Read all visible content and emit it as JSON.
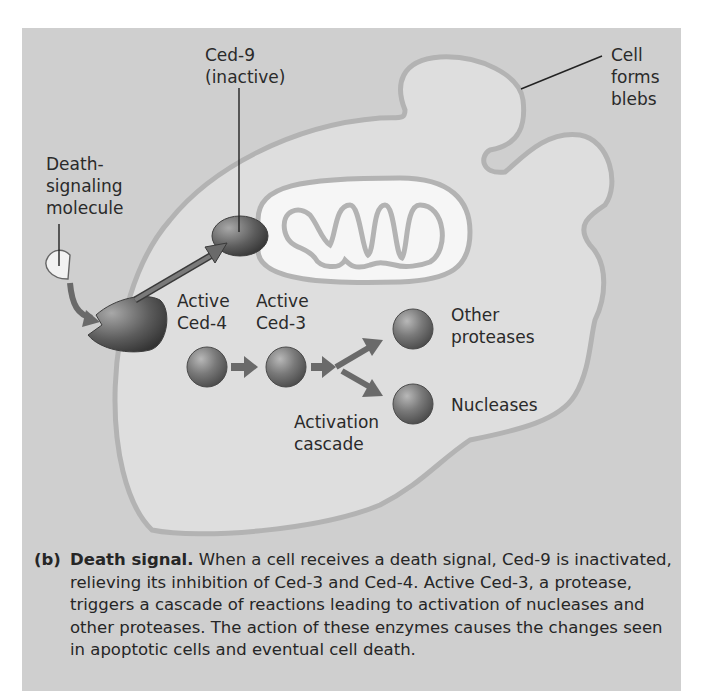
{
  "figure": {
    "panel_color": "#cfcfcf",
    "cell_fill": "#dedede",
    "membrane_color": "#b5b5b5",
    "protein_color": "#6e6e6e",
    "labels": {
      "ced9": [
        "Ced-9",
        "(inactive)"
      ],
      "death_molecule": [
        "Death-",
        "signaling",
        "molecule"
      ],
      "cell_blebs": [
        "Cell",
        "forms",
        "blebs"
      ],
      "active_ced4": [
        "Active",
        "Ced-4"
      ],
      "active_ced3": [
        "Active",
        "Ced-3"
      ],
      "other_proteases": [
        "Other",
        "proteases"
      ],
      "nucleases": [
        "Nucleases"
      ],
      "activation_cascade": [
        "Activation",
        "cascade"
      ]
    }
  },
  "caption": {
    "tag": "(b)",
    "title": "Death signal.",
    "text": " When a cell receives a death signal, Ced-9 is inactivated, relieving its inhibition of Ced-3 and Ced-4. Active Ced-3, a protease, triggers a cascade of reactions leading to activation of nucleases and other proteases. The action of these enzymes causes the changes seen in apoptotic cells and eventual cell death."
  }
}
